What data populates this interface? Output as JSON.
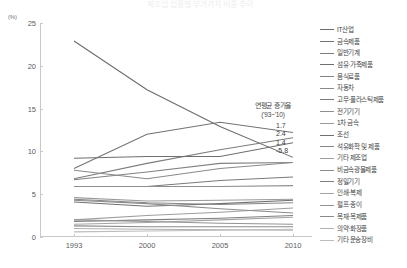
{
  "title_strip": "제조업 업종별 부가가치 비중 추이",
  "chart_data": {
    "type": "line",
    "title": "제조업 업종별 부가가치 비중 추이",
    "xlabel": "",
    "ylabel": "(%)",
    "y_unit": "(%)",
    "ylim": [
      0,
      25
    ],
    "yticks": [
      0,
      5,
      10,
      15,
      20,
      25
    ],
    "ytick_labels": [
      "0",
      "5",
      "10",
      "15",
      "20",
      "25"
    ],
    "x": [
      1993,
      2000,
      2005,
      2010
    ],
    "xtick_labels": [
      "1993",
      "2000",
      "2005",
      "2010"
    ],
    "categories": [
      "1993",
      "2000",
      "2005",
      "2010"
    ],
    "grid": false,
    "legend_position": "right",
    "series": [
      {
        "name": "IT산업",
        "values": [
          22.9,
          17.2,
          12.9,
          9.3
        ],
        "color": "#6b6b6b"
      },
      {
        "name": "금속제품",
        "values": [
          8.0,
          12.0,
          13.4,
          12.2
        ],
        "color": "#737373"
      },
      {
        "name": "일반기계",
        "values": [
          6.8,
          8.6,
          10.2,
          11.6
        ],
        "color": "#7d7d7d"
      },
      {
        "name": "섬유·가죽제품",
        "values": [
          9.2,
          9.4,
          9.4,
          11.0
        ],
        "color": "#6f6f6f"
      },
      {
        "name": "음식료품",
        "values": [
          6.7,
          7.6,
          8.6,
          8.7
        ],
        "color": "#828282"
      },
      {
        "name": "자동차",
        "values": [
          7.8,
          6.8,
          8.0,
          8.7
        ],
        "color": "#8a8a8a"
      },
      {
        "name": "고무·플라스틱제품",
        "values": [
          5.9,
          5.9,
          6.6,
          7.0
        ],
        "color": "#7a7a7a"
      },
      {
        "name": "전기기기",
        "values": [
          5.9,
          5.9,
          5.9,
          6.0
        ],
        "color": "#8f8f8f"
      },
      {
        "name": "1차 금속",
        "values": [
          4.6,
          4.2,
          4.3,
          4.4
        ],
        "color": "#9a9a9a"
      },
      {
        "name": "조선",
        "values": [
          4.1,
          3.6,
          3.9,
          4.3
        ],
        "color": "#717171"
      },
      {
        "name": "석유화학 및 제품",
        "values": [
          4.4,
          4.0,
          3.8,
          4.0
        ],
        "color": "#878787"
      },
      {
        "name": "기타 제조업",
        "values": [
          2.0,
          2.5,
          2.9,
          3.4
        ],
        "color": "#9d9d9d"
      },
      {
        "name": "비금속광물제품",
        "values": [
          4.3,
          3.9,
          3.3,
          2.8
        ],
        "color": "#8c8c8c"
      },
      {
        "name": "정밀기기",
        "values": [
          1.8,
          2.0,
          2.2,
          2.5
        ],
        "color": "#7f7f7f"
      },
      {
        "name": "인쇄·복제",
        "values": [
          1.5,
          1.7,
          2.0,
          2.3
        ],
        "color": "#a5a5a5"
      },
      {
        "name": "펄프·종이",
        "values": [
          2.0,
          1.8,
          1.6,
          1.5
        ],
        "color": "#949494"
      },
      {
        "name": "목재·목제품",
        "values": [
          1.3,
          1.2,
          1.2,
          1.2
        ],
        "color": "#8a8a8a"
      },
      {
        "name": "의약·화장품",
        "values": [
          1.0,
          0.9,
          0.85,
          0.8
        ],
        "color": "#b0b0b0"
      },
      {
        "name": "기타 운송장비",
        "values": [
          0.6,
          0.7,
          0.8,
          0.9
        ],
        "color": "#bcbcbc"
      }
    ],
    "annotation": {
      "title": "연평균 증가율",
      "subtitle": "('93~'10)",
      "values": [
        "1.7",
        "2.4",
        "1.4",
        "-5.8"
      ]
    }
  }
}
